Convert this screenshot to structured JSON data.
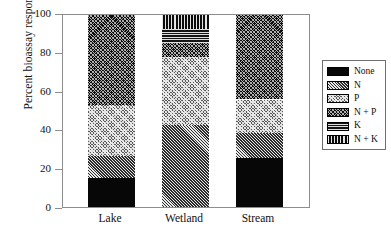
{
  "chart_data": {
    "type": "bar",
    "subtype": "stacked-bar-100",
    "title": "",
    "xlabel": "",
    "ylabel": "Percent bioassay responses",
    "categories": [
      "Lake",
      "Wetland",
      "Stream"
    ],
    "ylim": [
      0,
      100
    ],
    "yticks": [
      0,
      20,
      40,
      60,
      80,
      100
    ],
    "ytick_labels": [
      "0",
      "20",
      "40",
      "60",
      "80",
      "100"
    ],
    "grid": false,
    "legend_position": "right",
    "series": [
      {
        "name": "None",
        "pattern": "solid-black",
        "values": [
          15.0,
          0.0,
          25.5
        ]
      },
      {
        "name": "N",
        "pattern": "diagonal-hatch",
        "values": [
          11.5,
          42.5,
          13.0
        ]
      },
      {
        "name": "P",
        "pattern": "light-crosshatch",
        "values": [
          26.5,
          35.5,
          17.5
        ]
      },
      {
        "name": "N + P",
        "pattern": "fine-dark-dotted",
        "values": [
          47.0,
          7.5,
          44.0
        ]
      },
      {
        "name": "K",
        "pattern": "horizontal-stripes",
        "values": [
          0.0,
          7.0,
          0.0
        ]
      },
      {
        "name": "N + K",
        "pattern": "vertical-stripes",
        "values": [
          0.0,
          7.5,
          0.0
        ]
      }
    ],
    "cumulative_tops": {
      "Lake": [
        15.0,
        26.5,
        53.0,
        100.0,
        100.0,
        100.0
      ],
      "Wetland": [
        0.0,
        42.5,
        78.0,
        85.5,
        92.5,
        100.0
      ],
      "Stream": [
        25.5,
        38.5,
        56.0,
        100.0,
        100.0,
        100.0
      ]
    }
  },
  "legend": {
    "items": [
      {
        "label": "None"
      },
      {
        "label": "N"
      },
      {
        "label": "P"
      },
      {
        "label": "N + P"
      },
      {
        "label": "K"
      },
      {
        "label": "N + K"
      }
    ]
  },
  "colors": {
    "axis": "#8d8d8d",
    "text": "#111111",
    "background": "#ffffff",
    "legend_border": "#6f6f6f"
  }
}
